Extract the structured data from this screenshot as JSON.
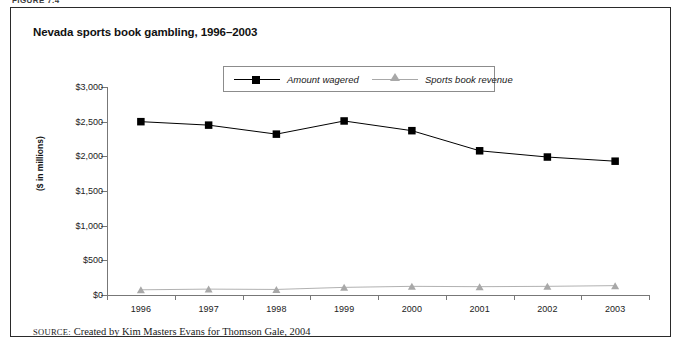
{
  "figure": {
    "label": "FIGURE 7.4",
    "title": "Nevada sports book gambling, 1996–2003",
    "source": "Created by Kim Masters Evans for Thomson Gale, 2004",
    "source_prefix": "SOURCE:"
  },
  "colors": {
    "wagered": "#000000",
    "revenue": "#a8a8a8",
    "axis": "#777777",
    "frame": "#2a2a2a",
    "background": "#ffffff"
  },
  "chart_data": {
    "type": "line",
    "title": "Nevada sports book gambling, 1996–2003",
    "xlabel": "",
    "ylabel": "($ in millions)",
    "categories": [
      "1996",
      "1997",
      "1998",
      "1999",
      "2000",
      "2001",
      "2002",
      "2003"
    ],
    "series": [
      {
        "name": "Amount wagered",
        "marker": "square",
        "color": "#000000",
        "values": [
          2500,
          2450,
          2320,
          2510,
          2370,
          2080,
          1990,
          1930
        ]
      },
      {
        "name": "Sports book revenue",
        "marker": "triangle",
        "color": "#a8a8a8",
        "values": [
          75,
          85,
          80,
          110,
          125,
          120,
          125,
          135
        ]
      }
    ],
    "ylim": [
      0,
      3000
    ],
    "yticks": [
      0,
      500,
      1000,
      1500,
      2000,
      2500,
      3000
    ],
    "ytick_labels": [
      "$0",
      "$500",
      "$1,000",
      "$1,500",
      "$2,000",
      "$2,500",
      "$3,000"
    ],
    "grid": false,
    "legend_position": "top-center"
  }
}
